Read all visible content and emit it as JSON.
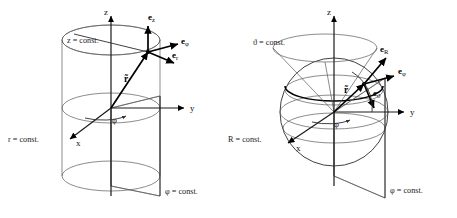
{
  "figure": {
    "background_color": "#ffffff",
    "line_color": "#5a5a5a",
    "accent_color": "#000000"
  },
  "panels": [
    {
      "id": "cylindrical",
      "name": "Cylindrical coordinates",
      "axes": {
        "z": "z",
        "y": "y",
        "x": "x"
      },
      "surfaces": [
        {
          "key": "z_const",
          "label": "z = const.",
          "shape": "plane-disk"
        },
        {
          "key": "r_const",
          "label": "r = const.",
          "shape": "cylinder"
        },
        {
          "key": "phi_const",
          "label": "φ = const.",
          "shape": "half-plane"
        }
      ],
      "unit_vectors": [
        {
          "key": "e_z",
          "base": "e",
          "sub": "z"
        },
        {
          "key": "e_phi",
          "base": "e",
          "sub": "φ"
        },
        {
          "key": "e_r",
          "base": "e",
          "sub": "r"
        }
      ],
      "position_vector": "r̃",
      "angle": "φ"
    },
    {
      "id": "spherical",
      "name": "Spherical coordinates",
      "axes": {
        "z": "z",
        "y": "y",
        "x": "x"
      },
      "surfaces": [
        {
          "key": "theta_const",
          "label": "ϑ = const.",
          "shape": "cone"
        },
        {
          "key": "R_const",
          "label": "R = const.",
          "shape": "sphere"
        },
        {
          "key": "phi_const",
          "label": "φ = const.",
          "shape": "half-plane"
        }
      ],
      "unit_vectors": [
        {
          "key": "e_R",
          "base": "e",
          "sub": "R"
        },
        {
          "key": "e_phi",
          "base": "e",
          "sub": "φ"
        },
        {
          "key": "e_theta",
          "base": "e",
          "sub": "ϑ"
        }
      ],
      "position_vector": "r̃",
      "angles": {
        "azimuth": "φ",
        "polar": "ϑ"
      }
    }
  ]
}
